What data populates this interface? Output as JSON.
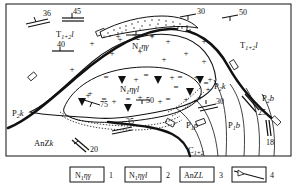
{
  "figure": {
    "type": "geological-map",
    "border": true,
    "background_color": "#ffffff",
    "line_color": "#111111"
  },
  "map": {
    "formations": [
      {
        "id": "f1",
        "label": "T",
        "sub": "1+2",
        "suffix": "l",
        "x": 68,
        "y": 36,
        "name": "triassic-lower-left"
      },
      {
        "id": "f2",
        "label": "T",
        "sub": "1+2",
        "suffix": "l",
        "x": 250,
        "y": 47,
        "name": "triassic-right"
      },
      {
        "id": "f3",
        "label": "N",
        "sub": "1",
        "suffix": "ηγ",
        "x": 143,
        "y": 48,
        "name": "neogene-granite-outer"
      },
      {
        "id": "f4",
        "label": "N",
        "sub": "1",
        "suffix": "ηγl",
        "x": 130,
        "y": 91,
        "name": "neogene-granite-inner"
      },
      {
        "id": "f5",
        "label": "P",
        "sub": "2",
        "suffix": "k",
        "x": 14,
        "y": 115,
        "name": "permian-k-left"
      },
      {
        "id": "f6",
        "label": "P",
        "sub": "2",
        "suffix": "k",
        "x": 219,
        "y": 88,
        "name": "permian-k-right"
      },
      {
        "id": "f7",
        "label": "P",
        "sub": "2",
        "suffix": "b",
        "x": 268,
        "y": 100,
        "name": "permian-b-far-right"
      },
      {
        "id": "f8",
        "label": "P",
        "sub": "1",
        "suffix": "p",
        "x": 193,
        "y": 127,
        "name": "permian-p"
      },
      {
        "id": "f9",
        "label": "P",
        "sub": "1",
        "suffix": "b",
        "x": 234,
        "y": 127,
        "name": "permian-b"
      },
      {
        "id": "f10",
        "label": "C",
        "sub": "1+2",
        "suffix": "",
        "x": 195,
        "y": 152,
        "name": "carboniferous"
      },
      {
        "id": "f11",
        "label": "AnZ",
        "sub": "",
        "suffix": "k",
        "x": 45,
        "y": 145,
        "name": "anzk-basement"
      }
    ],
    "dip_symbols": [
      {
        "value": "36",
        "x": 43,
        "y": 15,
        "rot": -10,
        "name": "dip-36"
      },
      {
        "value": "45",
        "x": 73,
        "y": 13,
        "rot": 0,
        "name": "dip-45"
      },
      {
        "value": "40",
        "x": 60,
        "y": 47,
        "rot": 0,
        "name": "dip-40"
      },
      {
        "value": "30",
        "x": 196,
        "y": 14,
        "rot": -6,
        "name": "dip-30-top"
      },
      {
        "value": "50",
        "x": 238,
        "y": 15,
        "rot": -6,
        "name": "dip-50-top"
      },
      {
        "value": "32",
        "x": 136,
        "y": 39,
        "rot": 0,
        "name": "dip-32-crest"
      },
      {
        "value": "75",
        "x": 100,
        "y": 105,
        "rot": -10,
        "name": "dip-75"
      },
      {
        "value": "50",
        "x": 146,
        "y": 102,
        "rot": 0,
        "name": "dip-50-inner"
      },
      {
        "value": "35",
        "x": 130,
        "y": 123,
        "rot": -8,
        "name": "dip-35"
      },
      {
        "value": "30",
        "x": 216,
        "y": 102,
        "rot": -8,
        "name": "dip-30-right"
      },
      {
        "value": "25",
        "x": 259,
        "y": 110,
        "rot": -55,
        "name": "dip-25"
      },
      {
        "value": "18",
        "x": 273,
        "y": 137,
        "rot": -80,
        "name": "dip-18"
      },
      {
        "value": "20",
        "x": 87,
        "y": 147,
        "rot": -45,
        "name": "dip-20"
      }
    ]
  },
  "legend": {
    "items": [
      {
        "num": "1",
        "label": "N",
        "sub": "1",
        "suffix": "ηγ",
        "name": "legend-item-1"
      },
      {
        "num": "2",
        "label": "N",
        "sub": "1",
        "suffix": "ηγl",
        "name": "legend-item-2"
      },
      {
        "num": "3",
        "label": "AnZ",
        "sub": "",
        "suffix": "L",
        "name": "legend-item-3"
      },
      {
        "num": "4",
        "label": "",
        "sub": "",
        "suffix": "",
        "name": "legend-item-4-fault-symbol"
      }
    ]
  }
}
